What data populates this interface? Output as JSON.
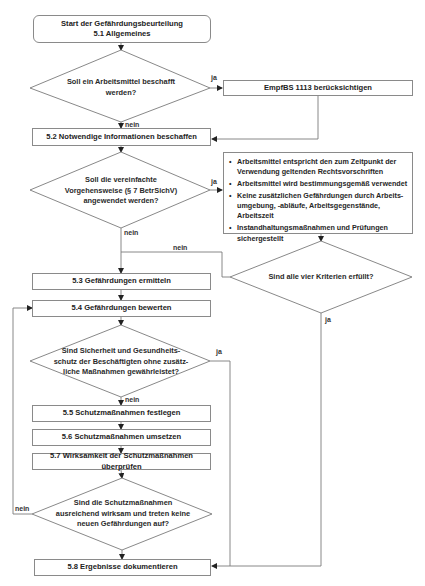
{
  "flowchart": {
    "start": {
      "title": "Start der Gefährdungsbeurteilung",
      "subtitle": "5.1 Allgemeines"
    },
    "decisions": [
      {
        "id": "d1",
        "text": "Soll ein Arbeitsmittel beschafft werden?",
        "yes": "ja",
        "no": "nein"
      },
      {
        "id": "d2",
        "text": "Soll die vereinfachte Vorgehensweise (§ 7 BetrSichV) angewendet werden?",
        "yes": "ja",
        "no": "nein"
      },
      {
        "id": "d3",
        "text": "Sind alle vier Kriterien erfüllt?",
        "yes": "ja",
        "no": "nein"
      },
      {
        "id": "d4",
        "text": "Sind Sicherheit und Gesundheits-schutz der Beschäftigten ohne zusätz-liche Maßnahmen gewährleistet?",
        "yes": "ja",
        "no": "nein"
      },
      {
        "id": "d5",
        "text": "Sind die Schutzmaßnahmen ausreichend wirksam und treten keine neuen Gefährdungen auf?",
        "yes": "",
        "no": "nein"
      }
    ],
    "d4_lines": [
      "Sind Sicherheit und Gesundheits-",
      "schutz der Beschäftigten ohne zusätz-",
      "liche Maßnahmen gewährleistet?"
    ],
    "d2_lines": [
      "Soll die vereinfachte",
      "Vorgehensweise (§ 7 BetrSichV)",
      "angewendet werden?"
    ],
    "d1_lines": [
      "Soll ein Arbeitsmittel beschafft",
      "werden?"
    ],
    "d5_lines": [
      "Sind die Schutzmaßnahmen",
      "ausreichend wirksam und treten keine",
      "neuen Gefährdungen auf?"
    ],
    "steps": {
      "empfbs": "EmpfBS 1113 berücksichtigen",
      "s52": "5.2 Notwendige Informationen beschaffen",
      "s53": "5.3 Gefährdungen ermitteln",
      "s54": "5.4 Gefährdungen bewerten",
      "s55": "5.5 Schutzmaßnahmen festlegen",
      "s56": "5.6 Schutzmaßnahmen umsetzen",
      "s57": "5.7 Wirksamkeit der Schutzmaßnahmen überprüfen",
      "s58": "5.8 Ergebnisse dokumentieren"
    },
    "criteria": [
      "Arbeitsmittel entspricht den zum Zeitpunkt der Verwendung geltenden Rechtsvorschriften",
      "Arbeitsmittel wird bestimmungsgemäß verwendet",
      "Keine zusätzlichen Gefährdungen durch Arbeits-umgebung, -abläufe, Arbeitsgegenstände, Arbeitszeit",
      "Instandhaltungsmaßnahmen und Prüfungen sichergestellt"
    ],
    "labels": {
      "ja": "ja",
      "nein": "nein"
    }
  },
  "colors": {
    "line": "#7a7a7a",
    "arrow": "#222222",
    "border": "#8a8a8a",
    "text": "#222222"
  }
}
